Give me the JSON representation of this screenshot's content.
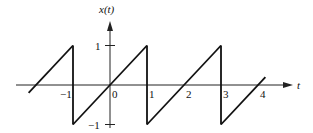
{
  "chart_data": {
    "type": "line",
    "title": "",
    "ylabel": "x(t)",
    "xlabel": "t",
    "x_ticks": [
      {
        "value": -1,
        "label": "−1"
      },
      {
        "value": 0,
        "label": "0"
      },
      {
        "value": 1,
        "label": "1"
      },
      {
        "value": 2,
        "label": "2"
      },
      {
        "value": 3,
        "label": "3"
      },
      {
        "value": 4,
        "label": "4"
      }
    ],
    "y_ticks": [
      {
        "value": 1,
        "label": "1"
      },
      {
        "value": -1,
        "label": "−1"
      }
    ],
    "xlim": [
      -2.2,
      4.2
    ],
    "ylim": [
      -1,
      1
    ],
    "grid": false,
    "series": [
      {
        "name": "x(t)",
        "description": "periodic sawtooth, period 2, slope 1, jumps from 1 to -1 at odd t",
        "points": [
          [
            -2.2,
            -0.2
          ],
          [
            -1,
            1
          ],
          [
            -1,
            -1
          ],
          [
            1,
            1
          ],
          [
            1,
            -1
          ],
          [
            3,
            1
          ],
          [
            3,
            -1
          ],
          [
            4.2,
            0.2
          ]
        ]
      }
    ]
  }
}
